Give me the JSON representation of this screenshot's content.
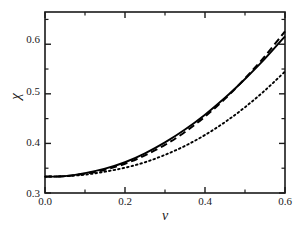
{
  "figure": {
    "background_color": "#ffffff",
    "axis_color": "#1a1a1a",
    "curve_color": "#000000"
  },
  "axes": {
    "x_label": "v",
    "y_label": "χ",
    "x_ticks_major": [
      "0.0",
      "0.2",
      "0.4",
      "0.6"
    ],
    "x_ticks_major_values": [
      0.0,
      0.2,
      0.4,
      0.6
    ],
    "x_ticks_minor_values": [
      0.1,
      0.3,
      0.5
    ],
    "y_ticks_major": [
      "0.3",
      "0.4",
      "0.5",
      "0.6"
    ],
    "y_ticks_major_values": [
      0.3,
      0.4,
      0.5,
      0.6
    ],
    "y_ticks_minor_values": [
      0.35,
      0.45,
      0.55,
      0.65
    ]
  },
  "chart_data": {
    "type": "line",
    "title": "",
    "xlabel": "v",
    "ylabel": "χ",
    "xlim": [
      0.0,
      0.6
    ],
    "ylim": [
      0.3,
      0.665
    ],
    "grid": false,
    "legend": "none",
    "xticks": [
      0.0,
      0.2,
      0.4,
      0.6
    ],
    "yticks": [
      0.3,
      0.4,
      0.5,
      0.6
    ],
    "xticks_minor": [
      0.1,
      0.3,
      0.5
    ],
    "yticks_minor": [
      0.35,
      0.45,
      0.55,
      0.65
    ],
    "series": [
      {
        "name": "solid",
        "linestyle": "solid",
        "color": "#000000",
        "x": [
          0.0,
          0.05,
          0.1,
          0.15,
          0.2,
          0.25,
          0.3,
          0.35,
          0.4,
          0.45,
          0.5,
          0.55,
          0.6
        ],
        "y": [
          0.333,
          0.334,
          0.34,
          0.349,
          0.362,
          0.38,
          0.402,
          0.428,
          0.458,
          0.492,
          0.53,
          0.571,
          0.616
        ]
      },
      {
        "name": "dashed",
        "linestyle": "dashed",
        "color": "#000000",
        "x": [
          0.0,
          0.05,
          0.1,
          0.15,
          0.2,
          0.25,
          0.3,
          0.35,
          0.4,
          0.45,
          0.5,
          0.55,
          0.6
        ],
        "y": [
          0.333,
          0.334,
          0.339,
          0.347,
          0.359,
          0.376,
          0.397,
          0.423,
          0.454,
          0.49,
          0.531,
          0.576,
          0.626
        ]
      },
      {
        "name": "dotted",
        "linestyle": "dotted",
        "color": "#000000",
        "x": [
          0.0,
          0.05,
          0.1,
          0.15,
          0.2,
          0.25,
          0.3,
          0.35,
          0.4,
          0.45,
          0.5,
          0.55,
          0.6
        ],
        "y": [
          0.333,
          0.334,
          0.337,
          0.343,
          0.351,
          0.362,
          0.377,
          0.395,
          0.417,
          0.443,
          0.473,
          0.507,
          0.545
        ]
      }
    ]
  }
}
